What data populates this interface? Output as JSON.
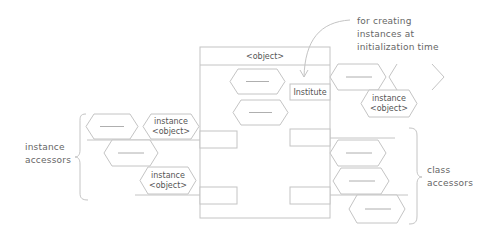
{
  "diagram": {
    "object_box": {
      "title": "<object>",
      "institute_label": "Institute"
    },
    "annotation": {
      "lines": [
        "for creating",
        "instances at",
        "initialization time"
      ]
    },
    "instance_object": {
      "line1": "instance",
      "line2": "<object>"
    },
    "left_group": {
      "label_lines": [
        "instance",
        "accessors"
      ]
    },
    "right_group": {
      "label_lines": [
        "class",
        "accessors"
      ]
    },
    "colors": {
      "stroke": "#c4c4c4",
      "text": "#555555",
      "background": "#ffffff"
    }
  }
}
